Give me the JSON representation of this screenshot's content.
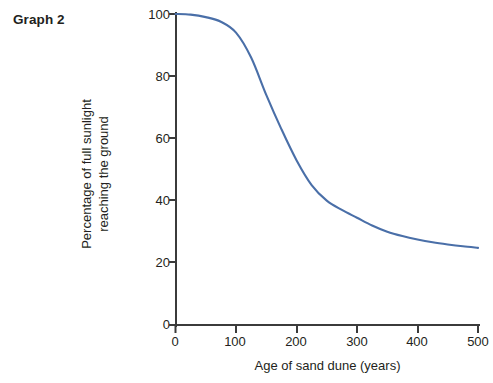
{
  "figure": {
    "label": "Graph 2"
  },
  "chart_data": {
    "type": "line",
    "title": "Graph 2",
    "xlabel": "Age of sand dune (years)",
    "ylabel": "Percentage of full sunlight reaching the ground",
    "ylabel_line1": "Percentage of full sunlight",
    "ylabel_line2": "reaching the ground",
    "xlim": [
      0,
      500
    ],
    "ylim": [
      0,
      100
    ],
    "xticks": [
      0,
      100,
      200,
      300,
      400,
      500
    ],
    "yticks": [
      0,
      20,
      40,
      60,
      80,
      100
    ],
    "xtick_labels": [
      "0",
      "100",
      "200",
      "300",
      "400",
      "500"
    ],
    "ytick_labels": [
      "0",
      "20",
      "40",
      "60",
      "80",
      "100"
    ],
    "grid": false,
    "legend": false,
    "series": [
      {
        "name": "Percentage of full sunlight reaching the ground",
        "color": "#4a6fa8",
        "x": [
          0,
          25,
          50,
          75,
          100,
          125,
          150,
          175,
          200,
          225,
          250,
          275,
          300,
          325,
          350,
          375,
          400,
          425,
          450,
          475,
          500
        ],
        "y": [
          100,
          99.8,
          99,
          97.5,
          94,
          86,
          74,
          63,
          53,
          45,
          40,
          37,
          34.5,
          32,
          30,
          28.6,
          27.5,
          26.6,
          25.9,
          25.3,
          24.8
        ]
      }
    ],
    "annotations": []
  },
  "colors": {
    "curve": "#4a6fa8",
    "axis": "#3b3b3b",
    "text": "#231f20",
    "background": "#ffffff"
  }
}
